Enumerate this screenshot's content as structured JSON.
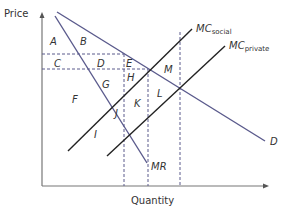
{
  "diagram": {
    "y_axis_label": "Price",
    "x_axis_label": "Quantity",
    "curves": {
      "demand": {
        "label": "D",
        "color": "#5a5a8c"
      },
      "marginal_revenue": {
        "label": "MR",
        "color": "#5a5a8c"
      },
      "mc_social": {
        "label_main": "MC",
        "label_sub": "social",
        "color": "#222222"
      },
      "mc_private": {
        "label_main": "MC",
        "label_sub": "private",
        "color": "#222222"
      }
    },
    "areas": {
      "A": "A",
      "B": "B",
      "C": "C",
      "D": "D",
      "E": "E",
      "F": "F",
      "G": "G",
      "H": "H",
      "I": "I",
      "J": "J",
      "K": "K",
      "L": "L",
      "M": "M"
    }
  }
}
